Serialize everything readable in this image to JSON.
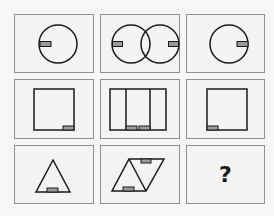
{
  "puzzle": {
    "stroke_color": "#1a1a1a",
    "marker_color": "#9a9a9a",
    "cells": [
      {
        "row": 1,
        "col": 1,
        "shape": "circle-marker-left"
      },
      {
        "row": 1,
        "col": 2,
        "shape": "two-overlapping-circles-markers-outer"
      },
      {
        "row": 1,
        "col": 3,
        "shape": "circle-marker-right"
      },
      {
        "row": 2,
        "col": 1,
        "shape": "square-marker-bottom-right"
      },
      {
        "row": 2,
        "col": 2,
        "shape": "three-panel-rectangle-markers-bottom-center"
      },
      {
        "row": 2,
        "col": 3,
        "shape": "square-marker-bottom-left"
      },
      {
        "row": 3,
        "col": 1,
        "shape": "triangle-marker-bottom"
      },
      {
        "row": 3,
        "col": 2,
        "shape": "parallelogram-two-triangles-markers-top-bottom"
      },
      {
        "row": 3,
        "col": 3,
        "shape": "unknown",
        "label": "?"
      }
    ]
  }
}
